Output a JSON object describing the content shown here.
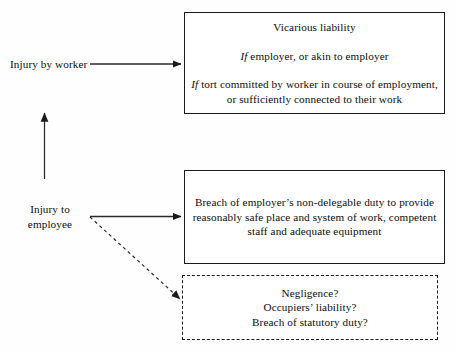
{
  "diagram": {
    "background_color": "#fefefe",
    "ink_color": "#1a1a1a"
  },
  "labels": {
    "injury_by_worker": "Injury by worker",
    "injury_to_employee_line1": "Injury to",
    "injury_to_employee_line2": "employee"
  },
  "boxes": {
    "vicarious": {
      "heading": "Vicarious liability",
      "condition1_prefix": "If",
      "condition1_text": " employer, or akin to employer",
      "condition2_prefix": "If",
      "condition2_line1": " tort committed by worker in course of employment,",
      "condition2_line2": "or sufficiently connected to their work"
    },
    "breach": {
      "line1": "Breach of employer’s non-delegable duty to provide",
      "line2": "reasonably safe place and system of work, competent",
      "line3": "staff and adequate equipment"
    },
    "alternatives": {
      "line1": "Negligence?",
      "line2": "Occupiers’ liability?",
      "line3": "Breach of statutory duty?"
    }
  },
  "connectors": {
    "worker_arrow": "solid-arrow-right",
    "employee_arrow": "solid-arrow-right",
    "upward_arrow": "solid-arrow-up",
    "alternatives_arrow": "dashed-arrow-diagonal"
  }
}
